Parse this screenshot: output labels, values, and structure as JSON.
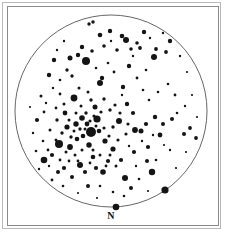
{
  "figure": {
    "kind": "telescope-eyepiece-star-chart",
    "title_visible": false,
    "frame": {
      "outer_border_color": "#b9b9b9",
      "inner_border_color": "#8a8a8a",
      "background_color": "#ffffff"
    },
    "compass": {
      "label": "N",
      "position": "bottom-center"
    }
  },
  "chart_data": {
    "type": "scatter",
    "title": "",
    "subtitle": "",
    "xlabel": "",
    "ylabel": "",
    "annotations": [
      {
        "text": "N",
        "x": 111,
        "y": 216,
        "meaning": "north direction marker"
      }
    ],
    "legend": {
      "visible": false,
      "entries": []
    },
    "grid": false,
    "axes_visible": false,
    "field_of_view": {
      "shape": "circle",
      "center_x": 111,
      "center_y": 111,
      "radius": 96,
      "stroke": "#555555",
      "stroke_width": 0.9,
      "fill": "none"
    },
    "marker_encoding": {
      "description": "dot radius encodes stellar brightness; larger = brighter",
      "color": "#141414",
      "radius_units": "pixels"
    },
    "star_count": 178,
    "stars": [
      {
        "x": 91,
        "y": 132,
        "r": 5.0
      },
      {
        "x": 86,
        "y": 61,
        "r": 4.0
      },
      {
        "x": 74,
        "y": 98,
        "r": 3.4
      },
      {
        "x": 59,
        "y": 144,
        "r": 4.0
      },
      {
        "x": 97,
        "y": 119,
        "r": 3.6
      },
      {
        "x": 44,
        "y": 160,
        "r": 3.3
      },
      {
        "x": 165,
        "y": 190,
        "r": 3.6
      },
      {
        "x": 116,
        "y": 207,
        "r": 3.3
      },
      {
        "x": 152,
        "y": 172,
        "r": 3.2
      },
      {
        "x": 154,
        "y": 57,
        "r": 3.0
      },
      {
        "x": 119,
        "y": 121,
        "r": 3.0
      },
      {
        "x": 80,
        "y": 165,
        "r": 3.0
      },
      {
        "x": 100,
        "y": 83,
        "r": 3.0
      },
      {
        "x": 126,
        "y": 40,
        "r": 3.0
      },
      {
        "x": 125,
        "y": 178,
        "r": 3.0
      },
      {
        "x": 70,
        "y": 147,
        "r": 2.9
      },
      {
        "x": 135,
        "y": 130,
        "r": 2.9
      },
      {
        "x": 37,
        "y": 120,
        "r": 2.1
      },
      {
        "x": 103,
        "y": 172,
        "r": 2.8
      },
      {
        "x": 82,
        "y": 118,
        "r": 2.8
      },
      {
        "x": 76,
        "y": 124,
        "r": 2.7
      },
      {
        "x": 89,
        "y": 145,
        "r": 2.7
      },
      {
        "x": 105,
        "y": 141,
        "r": 2.6
      },
      {
        "x": 113,
        "y": 149,
        "r": 2.6
      },
      {
        "x": 67,
        "y": 127,
        "r": 2.6
      },
      {
        "x": 70,
        "y": 58,
        "r": 2.5
      },
      {
        "x": 141,
        "y": 131,
        "r": 2.5
      },
      {
        "x": 95,
        "y": 107,
        "r": 2.5
      },
      {
        "x": 160,
        "y": 135,
        "r": 2.4
      },
      {
        "x": 65,
        "y": 113,
        "r": 2.4
      },
      {
        "x": 87,
        "y": 124,
        "r": 2.4
      },
      {
        "x": 99,
        "y": 131,
        "r": 2.3
      },
      {
        "x": 83,
        "y": 136,
        "r": 2.3
      },
      {
        "x": 77,
        "y": 139,
        "r": 2.3
      },
      {
        "x": 93,
        "y": 157,
        "r": 2.3
      },
      {
        "x": 122,
        "y": 36,
        "r": 2.3
      },
      {
        "x": 100,
        "y": 35,
        "r": 2.3
      },
      {
        "x": 110,
        "y": 31,
        "r": 2.2
      },
      {
        "x": 144,
        "y": 32,
        "r": 2.2
      },
      {
        "x": 170,
        "y": 41,
        "r": 2.2
      },
      {
        "x": 54,
        "y": 60,
        "r": 2.2
      },
      {
        "x": 78,
        "y": 55,
        "r": 2.2
      },
      {
        "x": 82,
        "y": 47,
        "r": 2.2
      },
      {
        "x": 129,
        "y": 66,
        "r": 2.2
      },
      {
        "x": 49,
        "y": 75,
        "r": 2.2
      },
      {
        "x": 102,
        "y": 78,
        "r": 2.2
      },
      {
        "x": 123,
        "y": 87,
        "r": 2.2
      },
      {
        "x": 127,
        "y": 104,
        "r": 2.2
      },
      {
        "x": 155,
        "y": 117,
        "r": 2.2
      },
      {
        "x": 133,
        "y": 113,
        "r": 2.1
      },
      {
        "x": 146,
        "y": 124,
        "r": 2.1
      },
      {
        "x": 148,
        "y": 147,
        "r": 2.1
      },
      {
        "x": 134,
        "y": 152,
        "r": 2.1
      },
      {
        "x": 121,
        "y": 160,
        "r": 2.1
      },
      {
        "x": 108,
        "y": 161,
        "r": 2.1
      },
      {
        "x": 96,
        "y": 168,
        "r": 2.1
      },
      {
        "x": 85,
        "y": 172,
        "r": 2.1
      },
      {
        "x": 64,
        "y": 168,
        "r": 2.1
      },
      {
        "x": 52,
        "y": 155,
        "r": 2.1
      },
      {
        "x": 58,
        "y": 172,
        "r": 2.0
      },
      {
        "x": 72,
        "y": 177,
        "r": 2.0
      },
      {
        "x": 88,
        "y": 186,
        "r": 2.0
      },
      {
        "x": 131,
        "y": 188,
        "r": 2.0
      },
      {
        "x": 147,
        "y": 161,
        "r": 2.0
      },
      {
        "x": 163,
        "y": 124,
        "r": 2.0
      },
      {
        "x": 172,
        "y": 119,
        "r": 2.0
      },
      {
        "x": 184,
        "y": 134,
        "r": 2.0
      },
      {
        "x": 190,
        "y": 128,
        "r": 1.9
      },
      {
        "x": 196,
        "y": 138,
        "r": 1.9
      },
      {
        "x": 166,
        "y": 52,
        "r": 1.9
      },
      {
        "x": 156,
        "y": 49,
        "r": 1.9
      },
      {
        "x": 140,
        "y": 48,
        "r": 1.9
      },
      {
        "x": 137,
        "y": 43,
        "r": 1.8
      },
      {
        "x": 131,
        "y": 49,
        "r": 1.8
      },
      {
        "x": 117,
        "y": 50,
        "r": 1.8
      },
      {
        "x": 104,
        "y": 46,
        "r": 1.8
      },
      {
        "x": 92,
        "y": 51,
        "r": 1.8
      },
      {
        "x": 89,
        "y": 24,
        "r": 1.7
      },
      {
        "x": 93,
        "y": 22,
        "r": 1.7
      },
      {
        "x": 67,
        "y": 70,
        "r": 1.7
      },
      {
        "x": 72,
        "y": 76,
        "r": 1.7
      },
      {
        "x": 41,
        "y": 96,
        "r": 1.5
      },
      {
        "x": 44,
        "y": 112,
        "r": 1.4
      },
      {
        "x": 57,
        "y": 120,
        "r": 1.7
      },
      {
        "x": 62,
        "y": 133,
        "r": 1.7
      },
      {
        "x": 71,
        "y": 137,
        "r": 1.7
      },
      {
        "x": 80,
        "y": 129,
        "r": 1.7
      },
      {
        "x": 86,
        "y": 113,
        "r": 1.7
      },
      {
        "x": 91,
        "y": 100,
        "r": 1.7
      },
      {
        "x": 104,
        "y": 99,
        "r": 1.7
      },
      {
        "x": 110,
        "y": 110,
        "r": 1.7
      },
      {
        "x": 113,
        "y": 127,
        "r": 1.7
      },
      {
        "x": 104,
        "y": 128,
        "r": 1.6
      },
      {
        "x": 109,
        "y": 136,
        "r": 1.6
      },
      {
        "x": 118,
        "y": 140,
        "r": 1.6
      },
      {
        "x": 126,
        "y": 134,
        "r": 1.6
      },
      {
        "x": 128,
        "y": 124,
        "r": 1.6
      },
      {
        "x": 120,
        "y": 113,
        "r": 1.6
      },
      {
        "x": 115,
        "y": 105,
        "r": 1.6
      },
      {
        "x": 101,
        "y": 112,
        "r": 1.6
      },
      {
        "x": 94,
        "y": 116,
        "r": 1.6
      },
      {
        "x": 90,
        "y": 121,
        "r": 1.6
      },
      {
        "x": 96,
        "y": 126,
        "r": 1.5
      },
      {
        "x": 85,
        "y": 129,
        "r": 1.5
      },
      {
        "x": 74,
        "y": 131,
        "r": 1.5
      },
      {
        "x": 69,
        "y": 120,
        "r": 1.5
      },
      {
        "x": 76,
        "y": 113,
        "r": 1.5
      },
      {
        "x": 81,
        "y": 106,
        "r": 1.5
      },
      {
        "x": 88,
        "y": 92,
        "r": 1.5
      },
      {
        "x": 79,
        "y": 88,
        "r": 1.5
      },
      {
        "x": 64,
        "y": 104,
        "r": 1.5
      },
      {
        "x": 56,
        "y": 108,
        "r": 1.4
      },
      {
        "x": 60,
        "y": 94,
        "r": 1.4
      },
      {
        "x": 50,
        "y": 130,
        "r": 1.5
      },
      {
        "x": 56,
        "y": 140,
        "r": 1.5
      },
      {
        "x": 66,
        "y": 152,
        "r": 1.5
      },
      {
        "x": 75,
        "y": 155,
        "r": 1.5
      },
      {
        "x": 82,
        "y": 150,
        "r": 1.5
      },
      {
        "x": 93,
        "y": 150,
        "r": 1.5
      },
      {
        "x": 100,
        "y": 155,
        "r": 1.5
      },
      {
        "x": 110,
        "y": 155,
        "r": 1.5
      },
      {
        "x": 116,
        "y": 166,
        "r": 1.5
      },
      {
        "x": 106,
        "y": 166,
        "r": 1.4
      },
      {
        "x": 90,
        "y": 163,
        "r": 1.4
      },
      {
        "x": 78,
        "y": 161,
        "r": 1.4
      },
      {
        "x": 69,
        "y": 161,
        "r": 1.4
      },
      {
        "x": 60,
        "y": 160,
        "r": 1.4
      },
      {
        "x": 48,
        "y": 150,
        "r": 1.4
      },
      {
        "x": 43,
        "y": 141,
        "r": 1.3
      },
      {
        "x": 36,
        "y": 151,
        "r": 1.3
      },
      {
        "x": 52,
        "y": 180,
        "r": 1.4
      },
      {
        "x": 63,
        "y": 186,
        "r": 1.3
      },
      {
        "x": 100,
        "y": 186,
        "r": 1.3
      },
      {
        "x": 113,
        "y": 192,
        "r": 1.3
      },
      {
        "x": 124,
        "y": 196,
        "r": 1.3
      },
      {
        "x": 139,
        "y": 179,
        "r": 1.3
      },
      {
        "x": 156,
        "y": 160,
        "r": 1.3
      },
      {
        "x": 170,
        "y": 150,
        "r": 1.2
      },
      {
        "x": 177,
        "y": 113,
        "r": 1.3
      },
      {
        "x": 185,
        "y": 106,
        "r": 1.2
      },
      {
        "x": 175,
        "y": 95,
        "r": 1.4
      },
      {
        "x": 168,
        "y": 84,
        "r": 1.3
      },
      {
        "x": 158,
        "y": 92,
        "r": 1.3
      },
      {
        "x": 149,
        "y": 100,
        "r": 1.3
      },
      {
        "x": 143,
        "y": 90,
        "r": 1.3
      },
      {
        "x": 137,
        "y": 78,
        "r": 1.4
      },
      {
        "x": 146,
        "y": 70,
        "r": 1.3
      },
      {
        "x": 114,
        "y": 72,
        "r": 1.4
      },
      {
        "x": 108,
        "y": 63,
        "r": 1.3
      },
      {
        "x": 96,
        "y": 68,
        "r": 1.3
      },
      {
        "x": 60,
        "y": 80,
        "r": 1.3
      },
      {
        "x": 53,
        "y": 88,
        "r": 1.2
      },
      {
        "x": 46,
        "y": 103,
        "r": 1.2
      },
      {
        "x": 33,
        "y": 133,
        "r": 1.2
      },
      {
        "x": 39,
        "y": 169,
        "r": 1.2
      },
      {
        "x": 30,
        "y": 107,
        "r": 1.1
      },
      {
        "x": 64,
        "y": 41,
        "r": 1.2
      },
      {
        "x": 57,
        "y": 50,
        "r": 1.2
      },
      {
        "x": 111,
        "y": 41,
        "r": 1.2
      },
      {
        "x": 133,
        "y": 56,
        "r": 1.2
      },
      {
        "x": 150,
        "y": 38,
        "r": 1.2
      },
      {
        "x": 163,
        "y": 33,
        "r": 1.2
      },
      {
        "x": 180,
        "y": 56,
        "r": 1.2
      },
      {
        "x": 187,
        "y": 72,
        "r": 1.1
      },
      {
        "x": 192,
        "y": 95,
        "r": 1.1
      },
      {
        "x": 197,
        "y": 117,
        "r": 1.1
      },
      {
        "x": 186,
        "y": 152,
        "r": 1.1
      },
      {
        "x": 176,
        "y": 168,
        "r": 1.1
      },
      {
        "x": 148,
        "y": 191,
        "r": 1.1
      },
      {
        "x": 97,
        "y": 198,
        "r": 1.1
      },
      {
        "x": 78,
        "y": 193,
        "r": 1.1
      },
      {
        "x": 136,
        "y": 166,
        "r": 1.2
      },
      {
        "x": 129,
        "y": 146,
        "r": 1.2
      },
      {
        "x": 153,
        "y": 135,
        "r": 1.2
      },
      {
        "x": 142,
        "y": 141,
        "r": 1.2
      },
      {
        "x": 164,
        "y": 145,
        "r": 1.1
      },
      {
        "x": 122,
        "y": 95,
        "r": 1.2
      },
      {
        "x": 49,
        "y": 166,
        "r": 1.2
      }
    ]
  }
}
